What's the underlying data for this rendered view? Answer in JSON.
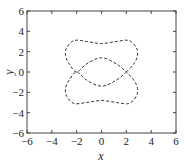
{
  "chart_data": {
    "type": "line",
    "title": "",
    "xlabel": "x",
    "ylabel": "y",
    "xlim": [
      -6,
      6
    ],
    "ylim": [
      -6,
      6
    ],
    "xticks": [
      -6,
      -4,
      -2,
      0,
      2,
      4,
      6
    ],
    "yticks": [
      -6,
      -4,
      -2,
      0,
      2,
      4,
      6
    ],
    "grid": false,
    "legend": null,
    "series": [
      {
        "name": "closed curve",
        "style": "dashed",
        "color": "#333333",
        "points": [
          [
            2.0,
            0.0
          ],
          [
            2.6,
            0.8
          ],
          [
            2.9,
            1.6
          ],
          [
            2.8,
            2.4
          ],
          [
            2.2,
            3.1
          ],
          [
            1.2,
            3.0
          ],
          [
            0.0,
            2.8
          ],
          [
            -1.2,
            3.0
          ],
          [
            -2.2,
            3.1
          ],
          [
            -2.8,
            2.4
          ],
          [
            -2.9,
            1.6
          ],
          [
            -2.6,
            0.8
          ],
          [
            -2.0,
            0.0
          ],
          [
            -1.2,
            0.8
          ],
          [
            0.0,
            1.4
          ],
          [
            1.2,
            0.8
          ],
          [
            2.0,
            0.0
          ],
          [
            2.6,
            -0.8
          ],
          [
            2.9,
            -1.6
          ],
          [
            2.8,
            -2.4
          ],
          [
            2.2,
            -3.1
          ],
          [
            1.2,
            -3.0
          ],
          [
            0.0,
            -2.8
          ],
          [
            -1.2,
            -3.0
          ],
          [
            -2.2,
            -3.1
          ],
          [
            -2.8,
            -2.4
          ],
          [
            -2.9,
            -1.6
          ],
          [
            -2.6,
            -0.8
          ],
          [
            -2.0,
            0.0
          ],
          [
            -1.2,
            -0.8
          ],
          [
            0.0,
            -1.4
          ],
          [
            1.2,
            -0.8
          ],
          [
            2.0,
            0.0
          ]
        ]
      }
    ]
  }
}
